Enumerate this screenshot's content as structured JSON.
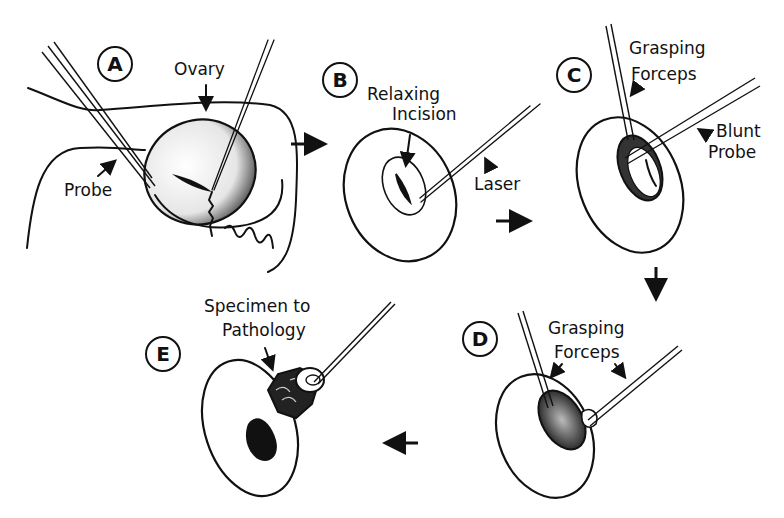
{
  "figure": {
    "steps": [
      {
        "id": "A",
        "labels": [
          "Ovary",
          "Probe"
        ]
      },
      {
        "id": "B",
        "labels": [
          "Relaxing",
          "Incision",
          "Laser"
        ]
      },
      {
        "id": "C",
        "labels": [
          "Grasping",
          "Forceps",
          "Blunt",
          "Probe"
        ]
      },
      {
        "id": "D",
        "labels": [
          "Grasping",
          "Forceps"
        ]
      },
      {
        "id": "E",
        "labels": [
          "Specimen to",
          "Pathology"
        ]
      }
    ],
    "flow": [
      "A",
      "B",
      "C",
      "D",
      "E"
    ],
    "colors": {
      "ink": "#111111",
      "paper": "#ffffff"
    }
  }
}
